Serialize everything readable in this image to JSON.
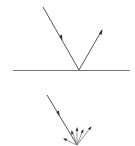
{
  "diagram": {
    "type": "reflection-diagram",
    "colors": {
      "line": "#555555",
      "surface": "#777777",
      "arrowhead": "#333333",
      "background": "#ffffff"
    },
    "specular_reflection": {
      "surface": {
        "x1": 13,
        "y1": 70,
        "x2": 130,
        "y2": 70
      },
      "incident_ray": {
        "x1": 43,
        "y1": 7,
        "x2": 79,
        "y2": 70,
        "arrow_at": [
          61,
          38
        ]
      },
      "reflected_ray": {
        "x1": 79,
        "y1": 70,
        "x2": 102,
        "y2": 30
      }
    },
    "diffuse_reflection": {
      "incident_ray": {
        "x1": 47,
        "y1": 95,
        "x2": 77,
        "y2": 145,
        "arrow_at": [
          58,
          114
        ]
      },
      "scattered_rays": [
        {
          "x2": 64,
          "y2": 139
        },
        {
          "x2": 72,
          "y2": 131
        },
        {
          "x2": 77,
          "y2": 128
        },
        {
          "x2": 83,
          "y2": 130
        },
        {
          "x2": 91,
          "y2": 127
        }
      ]
    }
  }
}
